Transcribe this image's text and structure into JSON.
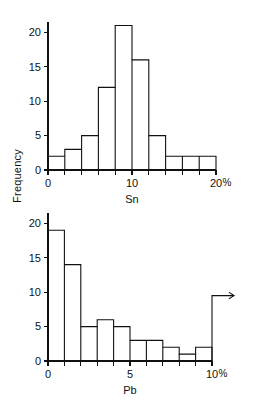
{
  "figure": {
    "shared_y_axis_label": "Frequency",
    "background_color": "#ffffff",
    "line_color": "#111111"
  },
  "chart_data": [
    {
      "type": "bar",
      "id": "sn-histogram",
      "title": "",
      "subtitle": "",
      "xlabel": "Sn",
      "ylabel": "Frequency",
      "x_unit": "%",
      "x_unit_label": "%",
      "categories": [
        "0-2",
        "2-4",
        "4-6",
        "6-8",
        "8-10",
        "10-12",
        "12-14",
        "14-16",
        "16-18",
        "18-20"
      ],
      "bin_edges": [
        0,
        2,
        4,
        6,
        8,
        10,
        12,
        14,
        16,
        18,
        20
      ],
      "values": [
        2,
        3,
        5,
        12,
        21,
        16,
        5,
        2,
        2,
        2
      ],
      "xlim": [
        0,
        20
      ],
      "ylim": [
        0,
        21.5
      ],
      "x_tick_values": [
        0,
        2,
        4,
        6,
        8,
        10,
        12,
        14,
        16,
        18,
        20
      ],
      "x_tick_labels": [
        "0",
        "",
        "",
        "",
        "",
        "10",
        "",
        "",
        "",
        "",
        "20"
      ],
      "y_tick_values": [
        0,
        5,
        10,
        15,
        20
      ],
      "y_tick_labels": [
        "0",
        "5",
        "10",
        "15",
        "20"
      ],
      "grid": false,
      "legend": false,
      "legend_position": "none",
      "annotations": []
    },
    {
      "type": "bar",
      "id": "pb-histogram",
      "title": "",
      "subtitle": "",
      "xlabel": "Pb",
      "ylabel": "Frequency",
      "x_unit": "%",
      "x_unit_label": "%",
      "categories": [
        "0-1",
        "1-2",
        "2-3",
        "3-4",
        "4-5",
        "5-6",
        "6-7",
        "7-8",
        "8-9",
        "9-10"
      ],
      "bin_edges": [
        0,
        1,
        2,
        3,
        4,
        5,
        6,
        7,
        8,
        9,
        10
      ],
      "values": [
        19,
        14,
        5,
        6,
        5,
        3,
        3,
        2,
        1,
        2
      ],
      "xlim": [
        0,
        10
      ],
      "ylim": [
        0,
        21.5
      ],
      "x_tick_values": [
        0,
        1,
        2,
        3,
        4,
        5,
        6,
        7,
        8,
        9,
        10
      ],
      "x_tick_labels": [
        "0",
        "",
        "",
        "",
        "",
        "5",
        "",
        "",
        "",
        "",
        "10"
      ],
      "y_tick_values": [
        0,
        5,
        10,
        15,
        20
      ],
      "y_tick_labels": [
        "0",
        "5",
        "10",
        "15",
        "20"
      ],
      "grid": false,
      "legend": false,
      "legend_position": "none",
      "annotations": [
        {
          "name": "overflow-arrow",
          "kind": "arrow",
          "direction": "right",
          "x": 10,
          "y": 9.5,
          "text": ""
        }
      ]
    }
  ]
}
